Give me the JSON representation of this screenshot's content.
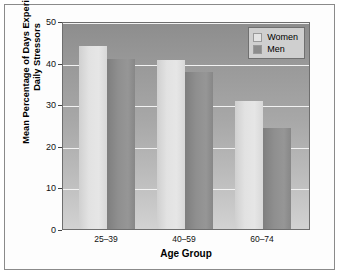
{
  "chart_data": {
    "type": "bar",
    "title": "",
    "xlabel": "Age Group",
    "ylabel": "Mean Percentage of Days Experiencing Daily Stressors",
    "categories": [
      "25–39",
      "40–59",
      "60–74"
    ],
    "series": [
      {
        "name": "Women",
        "values": [
          44.5,
          41.0,
          31.0
        ],
        "color": "#e4e4e4"
      },
      {
        "name": "Men",
        "values": [
          41.3,
          38.0,
          24.5
        ],
        "color": "#8c8c8c"
      }
    ],
    "ylim": [
      0,
      50
    ],
    "yticks": [
      0,
      10,
      20,
      30,
      40,
      50
    ],
    "ytick_labels": [
      "0",
      "10",
      "20",
      "30",
      "40",
      "50"
    ],
    "xtick_labels": [
      "25–39",
      "40–59",
      "60–74"
    ],
    "grid": true,
    "grid_color": "#f2f2f2",
    "legend_position": "top-right",
    "legend_entries": [
      "Women",
      "Men"
    ],
    "plot_background": "gray-vertical-gradient",
    "annotations": []
  },
  "legend": {
    "women_label": "Women",
    "men_label": "Men"
  },
  "axes": {
    "y_title": "Mean Percentage of Days Experiencing Daily Stressors",
    "y_title_line1": "Mean Percentage of Days Experiencing",
    "y_title_line2": "Daily Stressors",
    "x_title": "Age Group",
    "y_tick_0": "0",
    "y_tick_10": "10",
    "y_tick_20": "20",
    "y_tick_30": "30",
    "y_tick_40": "40",
    "y_tick_50": "50",
    "x_tick_0": "25–39",
    "x_tick_1": "40–59",
    "x_tick_2": "60–74"
  }
}
